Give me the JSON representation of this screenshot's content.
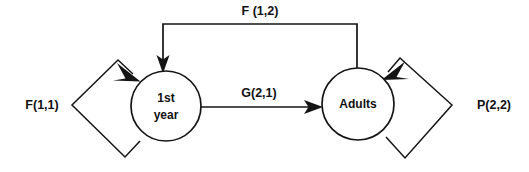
{
  "diagram": {
    "type": "state-transition-graph",
    "background_color": "#ffffff",
    "line_color": "#141414",
    "text_color": "#111111",
    "nodes": [
      {
        "id": "first-year",
        "label_line1": "1st",
        "label_line2": "year",
        "cx": 166,
        "cy": 106,
        "r": 35
      },
      {
        "id": "adults",
        "label_line1": "Adults",
        "label_line2": "",
        "cx": 358,
        "cy": 104,
        "r": 36
      }
    ],
    "edges": [
      {
        "id": "fertility-adults-to-first-year",
        "label": "F (1,2)",
        "from": "adults",
        "to": "first-year",
        "label_x": 260,
        "label_y": 12
      },
      {
        "id": "growth-first-year-to-adults",
        "label": "G(2,1)",
        "from": "first-year",
        "to": "adults",
        "label_x": 259,
        "label_y": 94
      },
      {
        "id": "fertility-first-year-self-loop",
        "label": "F(1,1)",
        "from": "first-year",
        "to": "first-year",
        "label_x": 42,
        "label_y": 106
      },
      {
        "id": "survival-adults-self-loop",
        "label": "P(2,2)",
        "from": "adults",
        "to": "adults",
        "label_x": 494,
        "label_y": 106
      }
    ]
  }
}
